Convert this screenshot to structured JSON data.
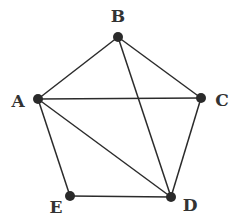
{
  "diagram": {
    "type": "graph",
    "nodes": [
      {
        "id": "A",
        "label": "A",
        "x": 38,
        "y": 99,
        "lx": 18,
        "ly": 107
      },
      {
        "id": "B",
        "label": "B",
        "x": 118,
        "y": 37,
        "lx": 118,
        "ly": 22
      },
      {
        "id": "C",
        "label": "C",
        "x": 201,
        "y": 98,
        "lx": 222,
        "ly": 106
      },
      {
        "id": "D",
        "label": "D",
        "x": 171,
        "y": 197,
        "lx": 190,
        "ly": 211
      },
      {
        "id": "E",
        "label": "E",
        "x": 70,
        "y": 196,
        "lx": 56,
        "ly": 213
      }
    ],
    "edges": [
      [
        "A",
        "B"
      ],
      [
        "B",
        "C"
      ],
      [
        "A",
        "C"
      ],
      [
        "B",
        "D"
      ],
      [
        "A",
        "D"
      ],
      [
        "A",
        "E"
      ],
      [
        "C",
        "D"
      ],
      [
        "E",
        "D"
      ]
    ],
    "colors": {
      "edge": "#2b2b2b",
      "node": "#2a2a2a",
      "label": "#333333"
    }
  }
}
